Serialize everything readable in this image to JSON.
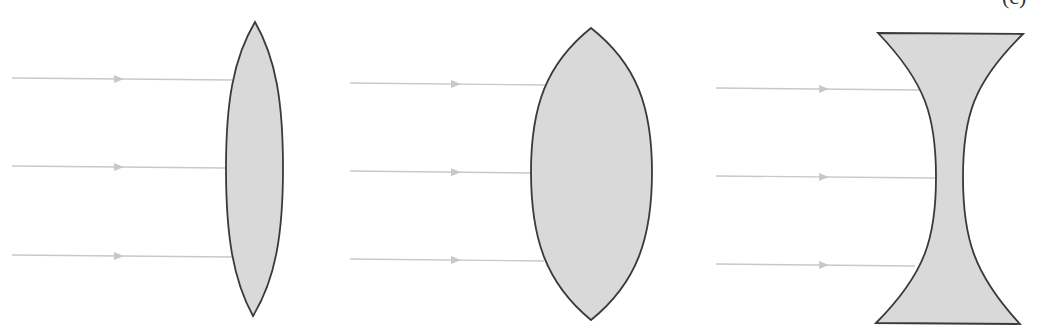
{
  "figure": {
    "colors": {
      "lens_fill": "#d9d9d9",
      "lens_stroke": "#3a3a3a",
      "ray": "#c8c8c8",
      "background": "#ffffff"
    },
    "partial_label": "(c)",
    "panels": [
      {
        "id": "thin-convex",
        "lens_type": "biconvex (thin)",
        "lens": {
          "top": [
            255,
            22
          ],
          "bottom": [
            253,
            316
          ],
          "left_x": 226,
          "right_x": 283,
          "mid_y": 168
        },
        "rays": [
          {
            "y_start": 78,
            "x_start": 12,
            "x_end": 232,
            "y_end": 80,
            "arrow_x": 122
          },
          {
            "y_start": 166,
            "x_start": 12,
            "x_end": 226,
            "y_end": 168,
            "arrow_x": 122
          },
          {
            "y_start": 255,
            "x_start": 12,
            "x_end": 232,
            "y_end": 257,
            "arrow_x": 122
          }
        ]
      },
      {
        "id": "thick-convex",
        "lens_type": "biconvex (thick)",
        "lens": {
          "top": [
            591,
            28
          ],
          "bottom": [
            591,
            320
          ],
          "left_x": 531,
          "right_x": 652,
          "mid_y": 172
        },
        "rays": [
          {
            "y_start": 83,
            "x_start": 350,
            "x_end": 546,
            "y_end": 85,
            "arrow_x": 459
          },
          {
            "y_start": 171,
            "x_start": 350,
            "x_end": 531,
            "y_end": 173,
            "arrow_x": 459
          },
          {
            "y_start": 259,
            "x_start": 350,
            "x_end": 544,
            "y_end": 261,
            "arrow_x": 459
          }
        ]
      },
      {
        "id": "concave",
        "lens_type": "biconcave",
        "lens": {
          "top_left": [
            878,
            33
          ],
          "top_right": [
            1023,
            34
          ],
          "bottom_left": [
            876,
            323
          ],
          "bottom_right": [
            1020,
            324
          ],
          "waist_left_x": 936,
          "waist_right_x": 963,
          "mid_y": 177
        },
        "rays": [
          {
            "y_start": 88,
            "x_start": 716,
            "x_end": 920,
            "y_end": 90,
            "arrow_x": 827
          },
          {
            "y_start": 176,
            "x_start": 716,
            "x_end": 936,
            "y_end": 178,
            "arrow_x": 827
          },
          {
            "y_start": 264,
            "x_start": 716,
            "x_end": 915,
            "y_end": 266,
            "arrow_x": 827
          }
        ]
      }
    ]
  }
}
